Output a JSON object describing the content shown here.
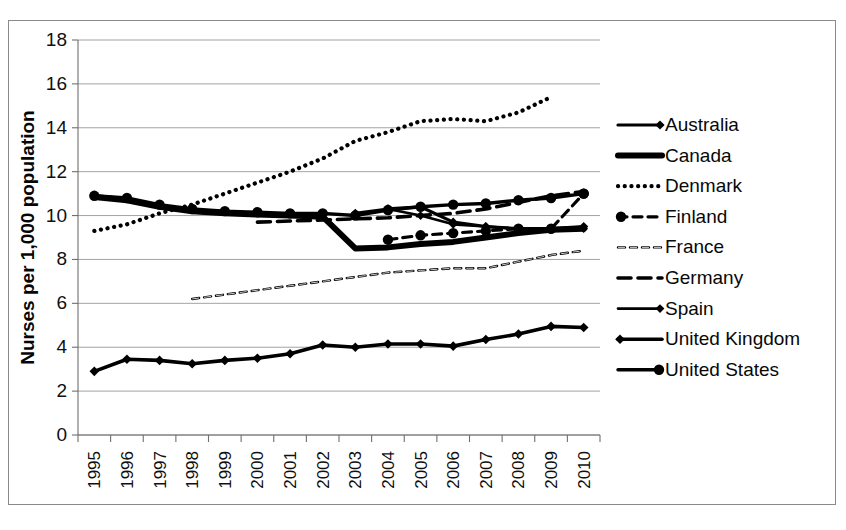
{
  "chart_data": {
    "type": "line",
    "title": "",
    "xlabel": "",
    "ylabel": "Nurses per 1,000 population",
    "ylim": [
      0,
      18
    ],
    "ytick_step": 2,
    "yticks": [
      "0",
      "2",
      "4",
      "6",
      "8",
      "10",
      "12",
      "14",
      "16",
      "18"
    ],
    "grid": true,
    "legend_position": "right",
    "x": [
      1995,
      1996,
      1997,
      1998,
      1999,
      2000,
      2001,
      2002,
      2003,
      2004,
      2005,
      2006,
      2007,
      2008,
      2009,
      2010
    ],
    "categories": [
      "1995",
      "1996",
      "1997",
      "1998",
      "1999",
      "2000",
      "2001",
      "2002",
      "2003",
      "2004",
      "2005",
      "2006",
      "2007",
      "2008",
      "2009",
      "2010"
    ],
    "series": [
      {
        "name": "Australia",
        "style": "solid-diamond",
        "values": [
          null,
          null,
          null,
          null,
          null,
          null,
          null,
          null,
          10.1,
          10.3,
          10.4,
          9.7,
          9.5,
          9.4,
          9.4,
          9.5
        ]
      },
      {
        "name": "Canada",
        "style": "solid-thick",
        "values": [
          10.85,
          10.7,
          10.4,
          10.2,
          10.1,
          10.05,
          10.0,
          9.95,
          8.5,
          8.55,
          8.7,
          8.8,
          9.0,
          9.2,
          9.35,
          9.4
        ]
      },
      {
        "name": "Denmark",
        "style": "dotted",
        "values": [
          9.3,
          9.6,
          10.1,
          10.5,
          11.0,
          11.5,
          12.0,
          12.6,
          13.4,
          13.8,
          14.3,
          14.4,
          14.3,
          14.7,
          15.4,
          null
        ]
      },
      {
        "name": "Finland",
        "style": "dashed-circle",
        "values": [
          null,
          null,
          null,
          null,
          null,
          null,
          null,
          null,
          null,
          8.9,
          9.1,
          9.2,
          9.3,
          9.4,
          9.4,
          11.0
        ]
      },
      {
        "name": "France",
        "style": "dashed-open",
        "values": [
          null,
          null,
          null,
          6.2,
          6.4,
          6.6,
          6.8,
          7.0,
          7.2,
          7.4,
          7.5,
          7.6,
          7.6,
          7.9,
          8.2,
          8.4
        ]
      },
      {
        "name": "Germany",
        "style": "dashed-long",
        "values": [
          null,
          null,
          null,
          null,
          null,
          9.7,
          9.75,
          9.8,
          9.85,
          9.9,
          10.0,
          10.1,
          10.3,
          10.6,
          10.9,
          11.1
        ]
      },
      {
        "name": "Spain",
        "style": "solid-diamond-thin",
        "values": [
          null,
          null,
          null,
          null,
          null,
          null,
          null,
          null,
          null,
          10.3,
          10.0,
          9.6,
          9.5,
          9.4,
          9.4,
          9.4
        ]
      },
      {
        "name": "United Kingdom",
        "style": "solid-diamond-bold",
        "values": [
          2.9,
          3.45,
          3.4,
          3.25,
          3.4,
          3.5,
          3.7,
          4.1,
          4.0,
          4.15,
          4.15,
          4.05,
          4.35,
          4.6,
          4.95,
          4.9
        ]
      },
      {
        "name": "United States",
        "style": "solid-circle",
        "values": [
          10.9,
          10.8,
          10.5,
          10.3,
          10.2,
          10.15,
          10.1,
          10.1,
          10.0,
          10.25,
          10.4,
          10.5,
          10.55,
          10.7,
          10.8,
          11.0
        ]
      }
    ]
  },
  "legend": {
    "items": [
      {
        "label": "Australia",
        "swatch": "solid-diamond"
      },
      {
        "label": "Canada",
        "swatch": "solid-thick"
      },
      {
        "label": "Denmark",
        "swatch": "dotted"
      },
      {
        "label": "Finland",
        "swatch": "dashed-circle"
      },
      {
        "label": "France",
        "swatch": "dashed-open"
      },
      {
        "label": "Germany",
        "swatch": "dashed-long"
      },
      {
        "label": "Spain",
        "swatch": "solid-diamond-thin"
      },
      {
        "label": "United Kingdom",
        "swatch": "solid-diamond-bold"
      },
      {
        "label": "United States",
        "swatch": "solid-circle"
      }
    ]
  },
  "colors": {
    "ink": "#000000",
    "grid": "#9a9a9a",
    "axis": "#6f6f6f",
    "frame": "#8a8a8a",
    "background": "#ffffff"
  }
}
